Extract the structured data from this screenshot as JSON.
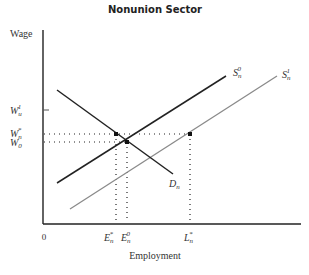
{
  "diagram": {
    "title": "Nonunion Sector",
    "y_axis_label": "Wage",
    "x_axis_label": "Employment",
    "origin_label": "0",
    "y_ticks": [
      {
        "base": "W",
        "sub": "u",
        "sup": "1",
        "label": "W_u^1"
      },
      {
        "base": "W",
        "sub": "n",
        "sup": "*",
        "label": "W_n^*"
      },
      {
        "base": "W",
        "sub": "0",
        "sup": "",
        "label": "W_0"
      }
    ],
    "x_ticks": [
      {
        "base": "E",
        "sub": "n",
        "sup": "*",
        "label": "E_n^*"
      },
      {
        "base": "E",
        "sub": "n",
        "sup": "0",
        "label": "E_n^0"
      },
      {
        "base": "L",
        "sub": "n",
        "sup": "*",
        "label": "L_n^*"
      }
    ],
    "curves": [
      {
        "id": "S0",
        "base": "S",
        "sub": "n",
        "sup": "0",
        "label": "S_n^0",
        "color": "#222222"
      },
      {
        "id": "S1",
        "base": "S",
        "sub": "n",
        "sup": "1",
        "label": "S_n^1",
        "color": "#8a8a8a"
      },
      {
        "id": "D",
        "base": "D",
        "sub": "n",
        "sup": "",
        "label": "D_n",
        "color": "#222222"
      }
    ]
  }
}
